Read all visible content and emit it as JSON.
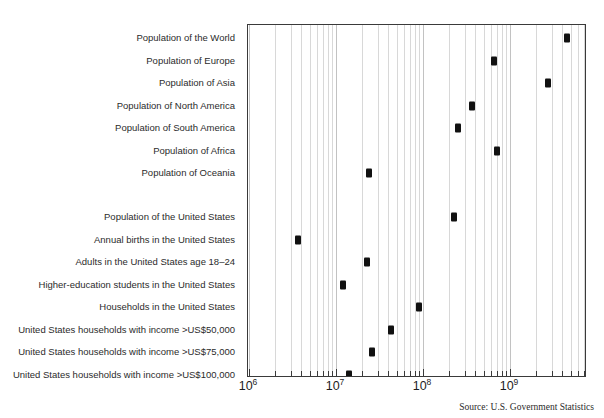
{
  "chart_data": {
    "type": "scatter",
    "title": "",
    "subtitle": "",
    "xlabel": "",
    "ylabel": "",
    "scale": "log10",
    "xlim": [
      1000000,
      6000000000
    ],
    "grid": true,
    "grid_orientation": "vertical",
    "legend": "none",
    "xtick_labels": [
      "10⁶",
      "10⁷",
      "10⁸",
      "10⁹"
    ],
    "xticks": [
      1000000,
      10000000,
      100000000,
      1000000000
    ],
    "xtick_bases": [
      "10",
      "10",
      "10",
      "10"
    ],
    "xtick_exponents": [
      "6",
      "7",
      "8",
      "9"
    ],
    "categories": [
      "Population of the World",
      "Population of Europe",
      "Population of Asia",
      "Population of North America",
      "Population of South America",
      "Population of Africa",
      "Population of Oceania",
      "",
      "Population of the United States",
      "Annual births in the United States",
      "Adults in the United States age 18–24",
      "Higher-education students in the United States",
      "Households in the United States",
      "United States households with income >US$50,000",
      "United States households with income >US$75,000",
      "United States households with income >US$100,000"
    ],
    "values": [
      4500000000,
      660000000,
      2700000000,
      370000000,
      250000000,
      700000000,
      24000000,
      null,
      230000000,
      3700000,
      23000000,
      12000000,
      90000000,
      43000000,
      26000000,
      14000000
    ],
    "points": [
      {
        "label": "Population of the World",
        "value": 4500000000
      },
      {
        "label": "Population of Europe",
        "value": 660000000
      },
      {
        "label": "Population of Asia",
        "value": 2700000000
      },
      {
        "label": "Population of North America",
        "value": 370000000
      },
      {
        "label": "Population of South America",
        "value": 250000000
      },
      {
        "label": "Population of Africa",
        "value": 700000000
      },
      {
        "label": "Population of Oceania",
        "value": 24000000
      },
      {
        "label": "Population of the United States",
        "value": 230000000
      },
      {
        "label": "Annual births in the United States",
        "value": 3700000
      },
      {
        "label": "Adults in the United States age 18–24",
        "value": 23000000
      },
      {
        "label": "Higher-education students in the United States",
        "value": 12000000
      },
      {
        "label": "Households in the United States",
        "value": 90000000
      },
      {
        "label": "United States households with income >US$50,000",
        "value": 43000000
      },
      {
        "label": "United States households with income >US$75,000",
        "value": 26000000
      },
      {
        "label": "United States households with income >US$100,000",
        "value": 14000000
      }
    ],
    "source": "Source: U.S. Government Statistics"
  },
  "labels": {
    "row0": "Population of the World",
    "row1": "Population of Europe",
    "row2": "Population of Asia",
    "row3": "Population of North America",
    "row4": "Population of South America",
    "row5": "Population of Africa",
    "row6": "Population of Oceania",
    "row7": "Population of the United States",
    "row8": "Annual births in the United States",
    "row9": "Adults in the United States age 18–24",
    "row10": "Higher-education students in the United States",
    "row11": "Households in the United States",
    "row12": "United States households with income >US$50,000",
    "row13": "United States households with income >US$75,000",
    "row14": "United States households with income >US$100,000"
  },
  "axis": {
    "tick1_base": "10",
    "tick1_exp": "6",
    "tick2_base": "10",
    "tick2_exp": "7",
    "tick3_base": "10",
    "tick3_exp": "8",
    "tick4_base": "10",
    "tick4_exp": "9"
  },
  "footer": {
    "source": "Source: U.S. Government Statistics"
  },
  "colors": {
    "marker": "#111111",
    "frame": "#3a3a3a",
    "gridline": "#d8d8d8",
    "text": "#2b2b2b",
    "background": "#ffffff"
  }
}
